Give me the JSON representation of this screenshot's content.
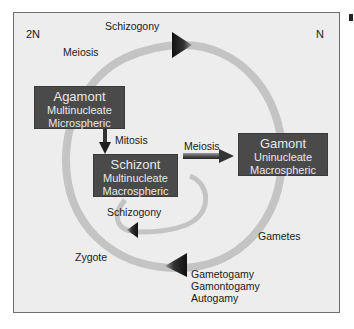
{
  "diagram": {
    "ploidy_left": "2N",
    "ploidy_right": "N",
    "labels": {
      "schizogony_top": "Schizogony",
      "meiosis_left": "Meiosis",
      "mitosis": "Mitosis",
      "meiosis_center": "Meiosis",
      "schizogony_inner": "Schizogony",
      "zygote": "Zygote",
      "gametes": "Gametes",
      "fusion": [
        "Gametogamy",
        "Gamontogamy",
        "Autogamy"
      ]
    },
    "boxes": {
      "agamont": {
        "title": "Agamont",
        "line1": "Multinucleate",
        "line2": "Microspheric"
      },
      "schizont": {
        "title": "Schizont",
        "line1": "Multinucleate",
        "line2": "Macrospheric"
      },
      "gamont": {
        "title": "Gamont",
        "line1": "Uninucleate",
        "line2": "Macrospheric"
      }
    },
    "colors": {
      "background": "#ededed",
      "box": "#4a4a4a",
      "box_text": "#e8e8e8",
      "ring": "#c4c4c4",
      "arrowhead": "#1e1e1e"
    }
  }
}
